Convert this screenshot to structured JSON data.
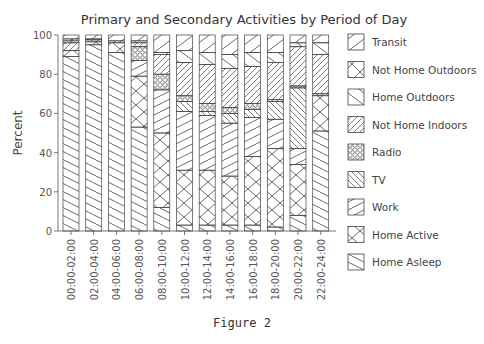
{
  "figure_caption": "Figure 2",
  "chart_data": {
    "type": "bar",
    "stacked": true,
    "title": "Primary and Secondary Activities by Period of Day",
    "xlabel": "",
    "ylabel": "Percent",
    "ylim": [
      0,
      100
    ],
    "yticks": [
      0,
      20,
      40,
      60,
      80,
      100
    ],
    "grid": false,
    "legend_position": "right",
    "categories": [
      "00:00-02:00",
      "02:00-04:00",
      "04:00-06:00",
      "06:00-08:00",
      "08:00-10:00",
      "10:00-12:00",
      "12:00-14:00",
      "14:00-16:00",
      "16:00-18:00",
      "18:00-20:00",
      "20:00-22:00",
      "22:00-24:00"
    ],
    "series": [
      {
        "name": "Home Asleep",
        "pattern": "diag-down",
        "values": [
          89,
          95,
          91,
          53,
          12,
          3,
          3,
          3,
          3,
          2,
          8,
          51
        ]
      },
      {
        "name": "Home Active",
        "pattern": "cross",
        "values": [
          3,
          1.5,
          5,
          26,
          38,
          28,
          28,
          25,
          35,
          40,
          26,
          18
        ]
      },
      {
        "name": "Work",
        "pattern": "diag-up",
        "values": [
          0,
          0,
          0,
          8,
          22,
          30,
          28,
          27,
          20,
          15,
          8,
          0
        ]
      },
      {
        "name": "TV",
        "pattern": "dense-down",
        "values": [
          0,
          0,
          0,
          0,
          0,
          5,
          2,
          5,
          4,
          9,
          31,
          0
        ]
      },
      {
        "name": "Radio",
        "pattern": "crosshatch",
        "values": [
          0,
          0,
          0,
          7,
          8,
          3,
          4,
          3,
          3,
          1,
          1,
          1
        ]
      },
      {
        "name": "Not Home Indoors",
        "pattern": "dense-up",
        "values": [
          4,
          1,
          1,
          2,
          10,
          17,
          20,
          20,
          19,
          19,
          20,
          20
        ]
      },
      {
        "name": "Home Outdoors",
        "pattern": "diag-down-sparse",
        "values": [
          1,
          0,
          0,
          1,
          1,
          6,
          6,
          7,
          7,
          5,
          2,
          6
        ]
      },
      {
        "name": "Not Home Outdoors",
        "pattern": "x",
        "values": [
          1,
          0.5,
          0,
          0,
          0,
          0,
          0,
          0,
          0,
          0,
          0,
          0
        ]
      },
      {
        "name": "Transit",
        "pattern": "diag-up-sparse",
        "values": [
          2,
          2,
          3,
          3,
          9,
          8,
          9,
          10,
          9,
          9,
          4,
          4
        ]
      }
    ],
    "legend": [
      "Transit",
      "Not Home Outdoors",
      "Home Outdoors",
      "Not Home Indoors",
      "Radio",
      "TV",
      "Work",
      "Home Active",
      "Home Asleep"
    ]
  }
}
